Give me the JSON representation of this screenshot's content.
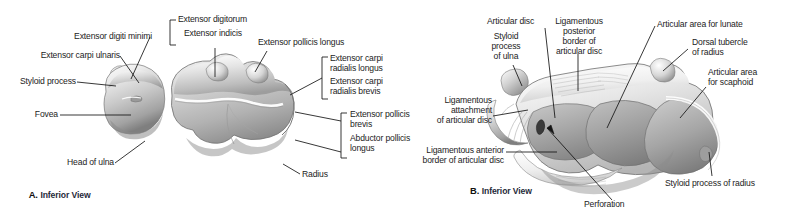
{
  "figure": {
    "background": "#ffffff",
    "ink": "#1c1c1c"
  },
  "panels": [
    {
      "id": "A",
      "letter": "A.",
      "view": "Inferior View",
      "subject": "distal-ends-of-radius-and-ulna",
      "labels": [
        {
          "name": "extensor-digiti-minimi",
          "text": "Extensor digiti minimi"
        },
        {
          "name": "extensor-carpi-ulnaris",
          "text": "Extensor carpi ulnaris"
        },
        {
          "name": "styloid-process",
          "text": "Styloid process"
        },
        {
          "name": "fovea",
          "text": "Fovea"
        },
        {
          "name": "head-of-ulna",
          "text": "Head of ulna"
        },
        {
          "name": "extensor-digitorum",
          "text": "Extensor digitorum"
        },
        {
          "name": "extensor-indicis",
          "text": "Extensor indicis"
        },
        {
          "name": "extensor-pollicis-longus",
          "text": "Extensor pollicis longus"
        },
        {
          "name": "extensor-carpi-radialis-longus",
          "text": "Extensor carpi\nradialis longus"
        },
        {
          "name": "extensor-carpi-radialis-brevis",
          "text": "Extensor carpi\nradialis brevis"
        },
        {
          "name": "extensor-pollicis-brevis",
          "text": "Extensor pollicis\nbrevis"
        },
        {
          "name": "abductor-pollicis-longus",
          "text": "Abductor pollicis\nlongus"
        },
        {
          "name": "radius",
          "text": "Radius"
        }
      ]
    },
    {
      "id": "B",
      "letter": "B.",
      "view": "Inferior View",
      "subject": "articular-disc-of-distal-radioulnar-joint",
      "labels": [
        {
          "name": "articular-disc",
          "text": "Articular disc"
        },
        {
          "name": "styloid-process-of-ulna",
          "text": "Styloid\nprocess\nof ulna"
        },
        {
          "name": "ligamentous-posterior-border-of-articular-disc",
          "text": "Ligamentous\nposterior\nborder of\narticular disc"
        },
        {
          "name": "articular-area-for-lunate",
          "text": "Articular area for lunate"
        },
        {
          "name": "dorsal-tubercle-of-radius",
          "text": "Dorsal tubercle\nof radius"
        },
        {
          "name": "articular-area-for-scaphoid",
          "text": "Articular area\nfor scaphoid"
        },
        {
          "name": "ligamentous-attachment-of-articular-disc",
          "text": "Ligamentous\nattachment\nof articular disc"
        },
        {
          "name": "ligamentous-anterior-border-of-articular-disc",
          "text": "Ligamentous anterior\nborder of articular disc"
        },
        {
          "name": "perforation",
          "text": "Perforation"
        },
        {
          "name": "styloid-process-of-radius",
          "text": "Styloid process of radius"
        }
      ]
    }
  ],
  "a": {
    "letter": "A.",
    "view": "Inferior View",
    "extensor_digiti_minimi": "Extensor digiti minimi",
    "extensor_carpi_ulnaris": "Extensor carpi ulnaris",
    "styloid_process": "Styloid process",
    "fovea": "Fovea",
    "head_of_ulna": "Head of ulna",
    "extensor_digitorum": "Extensor digitorum",
    "extensor_indicis": "Extensor indicis",
    "extensor_pollicis_longus": "Extensor pollicis longus",
    "ecrl_line1": "Extensor carpi",
    "ecrl_line2": "radialis longus",
    "ecrb_line1": "Extensor carpi",
    "ecrb_line2": "radialis brevis",
    "epb_line1": "Extensor pollicis",
    "epb_line2": "brevis",
    "apl_line1": "Abductor pollicis",
    "apl_line2": "longus",
    "radius": "Radius"
  },
  "b": {
    "letter": "B.",
    "view": "Inferior View",
    "articular_disc": "Articular disc",
    "styloid_process_of_ulna_l1": "Styloid",
    "styloid_process_of_ulna_l2": "process",
    "styloid_process_of_ulna_l3": "of ulna",
    "lig_post_l1": "Ligamentous",
    "lig_post_l2": "posterior",
    "lig_post_l3": "border of",
    "lig_post_l4": "articular disc",
    "articular_area_for_lunate": "Articular area for lunate",
    "dorsal_tubercle_l1": "Dorsal tubercle",
    "dorsal_tubercle_l2": "of radius",
    "articular_area_scaphoid_l1": "Articular area",
    "articular_area_scaphoid_l2": "for scaphoid",
    "lig_attach_l1": "Ligamentous",
    "lig_attach_l2": "attachment",
    "lig_attach_l3": "of articular disc",
    "lig_ant_l1": "Ligamentous anterior",
    "lig_ant_l2": "border of articular disc",
    "perforation": "Perforation",
    "styloid_process_of_radius": "Styloid process of radius"
  }
}
